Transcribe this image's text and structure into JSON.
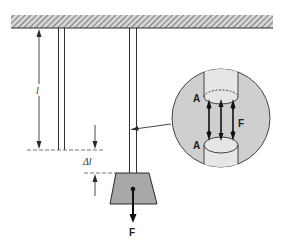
{
  "figure": {
    "type": "mechanics-diagram"
  },
  "labels": {
    "length": "l",
    "elongation": "Δl",
    "force_bottom": "F",
    "detail_force": "F",
    "area_top": "A",
    "area_bottom": "A"
  },
  "colors": {
    "stroke": "#2a2a2a",
    "hatch": "#555555",
    "ceiling_fill": "#d6d6d6",
    "weight_fill": "#a8a8a8",
    "detail_fill": "#cfcfcf",
    "tube_fill": "#e6e6e6",
    "background": "#ffffff"
  }
}
